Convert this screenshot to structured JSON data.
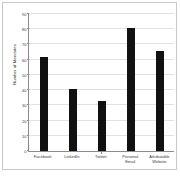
{
  "chart_data": {
    "type": "bar",
    "title": "",
    "subtitle": "",
    "xlabel": "",
    "ylabel": "Number of Mandates",
    "categories": [
      "Facebook",
      "LinkedIn",
      "Twitter",
      "Personal Email",
      "Attributable Website"
    ],
    "category_lines": [
      [
        "Facebook"
      ],
      [
        "LinkedIn"
      ],
      [
        "Twitter"
      ],
      [
        "Personal",
        "Email"
      ],
      [
        "Attributable",
        "Website"
      ]
    ],
    "values": [
      62,
      41,
      33,
      81,
      66
    ],
    "ylim": [
      0,
      90
    ],
    "ytick_values": [
      0,
      10,
      20,
      30,
      40,
      50,
      60,
      70,
      80,
      90
    ],
    "ytick_labels": [
      "0",
      "10",
      "20",
      "30",
      "40",
      "50",
      "60",
      "70",
      "80",
      "90"
    ],
    "grid": true,
    "legend": false,
    "legend_position": "none",
    "bar_color": "#111111",
    "grid_color": "#e2e2e2",
    "axis_color": "#8c8c8c",
    "background_color": "#ffffff"
  },
  "figure": {
    "caption_partial": ""
  }
}
